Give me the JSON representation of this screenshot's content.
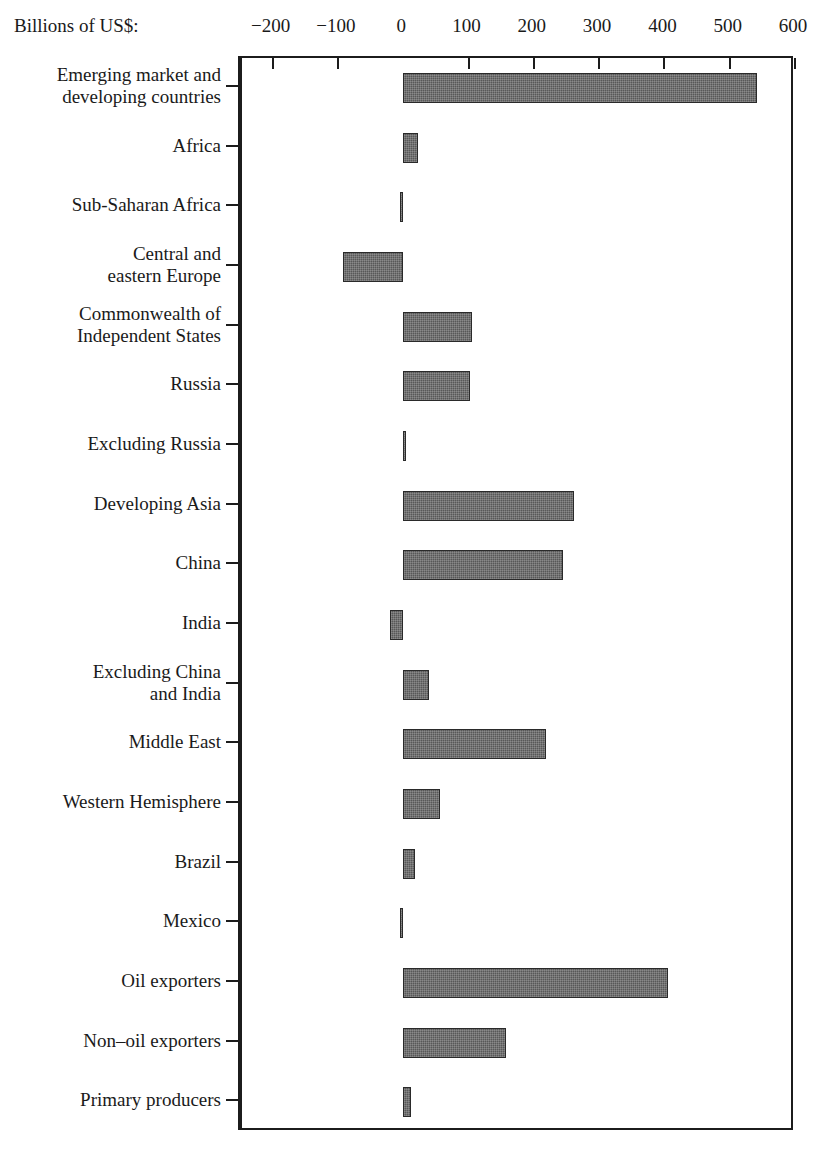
{
  "units_label": "Billions of US$:",
  "axis": {
    "ticks": [
      -200,
      -100,
      0,
      100,
      200,
      300,
      400,
      500,
      600
    ],
    "tick_labels": [
      "−200",
      "−100",
      "0",
      "100",
      "200",
      "300",
      "400",
      "500",
      "600"
    ],
    "min": -250,
    "max": 600
  },
  "colors": {
    "bar_fill": "#585858",
    "bar_outline": "#2a2a2a",
    "axis": "#1c1c1c",
    "background": "#ffffff",
    "text": "#1a1a1a"
  },
  "chart_data": {
    "type": "bar",
    "orientation": "horizontal",
    "title": "",
    "xlabel": "Billions of US$:",
    "ylabel": "",
    "xlim": [
      -250,
      600
    ],
    "grid": false,
    "legend": "none",
    "categories": [
      "Emerging market and\ndeveloping countries",
      "Africa",
      "Sub-Saharan Africa",
      "Central and\neastern Europe",
      "Commonwealth of\nIndependent States",
      "Russia",
      "Excluding Russia",
      "Developing Asia",
      "China",
      "India",
      "Excluding China\nand India",
      "Middle East",
      "Western Hemisphere",
      "Brazil",
      "Mexico",
      "Oil exporters",
      "Non–oil exporters",
      "Primary producers"
    ],
    "values": [
      542,
      23,
      -5,
      -92,
      106,
      102,
      5,
      261,
      245,
      -20,
      39,
      218,
      56,
      18,
      -5,
      405,
      158,
      12
    ]
  }
}
